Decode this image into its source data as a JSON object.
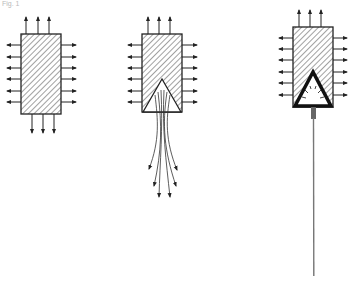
{
  "figure": {
    "label": "Fig. 1",
    "panels": [
      {
        "id": "intact",
        "description": "Hatched block with uniform outward stress arrows on all sides"
      },
      {
        "id": "wedge",
        "description": "Hatched block with triangular wedge cut at bottom; curved flow lines diverging downward"
      },
      {
        "id": "jet",
        "description": "Hatched block with heavy-outlined triangular cavity emitting a single narrow jet downward"
      }
    ],
    "colors": {
      "line": "#222222",
      "hatch": "#444444",
      "background": "#ffffff",
      "jet": "#777777"
    }
  }
}
